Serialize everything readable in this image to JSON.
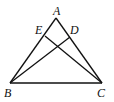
{
  "diagram": {
    "type": "geometry-triangle",
    "points": {
      "A": {
        "label": "A",
        "x": 56,
        "y": 18
      },
      "B": {
        "label": "B",
        "x": 10,
        "y": 83
      },
      "C": {
        "label": "C",
        "x": 102,
        "y": 83
      },
      "E": {
        "label": "E",
        "x": 45,
        "y": 36
      },
      "D": {
        "label": "D",
        "x": 70,
        "y": 37
      }
    },
    "segments": [
      "AB",
      "AC",
      "BC",
      "BD",
      "CE"
    ],
    "stroke_color": "#111111"
  }
}
